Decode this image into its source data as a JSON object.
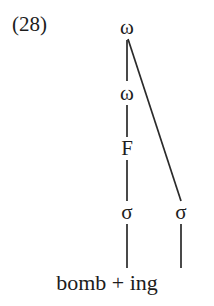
{
  "figure": {
    "example_number": "(28)",
    "terminal_string": "bomb + ing",
    "nodes": {
      "omega_top": "ω",
      "omega_second": "ω",
      "foot": "F",
      "sigma_left": "σ",
      "sigma_right": "σ"
    },
    "colors": {
      "background": "#ffffff",
      "text": "#1c1c1c",
      "edge": "#2a2a2a"
    },
    "edges": [
      {
        "name": "omega-top-to-omega-second",
        "x1": 127,
        "y1": 40,
        "x2": 127,
        "y2": 81
      },
      {
        "name": "omega-top-to-sigma-right",
        "x1": 128,
        "y1": 39,
        "x2": 181,
        "y2": 201
      },
      {
        "name": "omega-second-to-foot",
        "x1": 127,
        "y1": 105,
        "x2": 127,
        "y2": 137
      },
      {
        "name": "foot-to-sigma-left",
        "x1": 127,
        "y1": 160,
        "x2": 127,
        "y2": 201
      },
      {
        "name": "sigma-left-to-terminal",
        "x1": 127,
        "y1": 224,
        "x2": 127,
        "y2": 268
      },
      {
        "name": "sigma-right-to-terminal",
        "x1": 181,
        "y1": 224,
        "x2": 181,
        "y2": 268
      }
    ]
  }
}
